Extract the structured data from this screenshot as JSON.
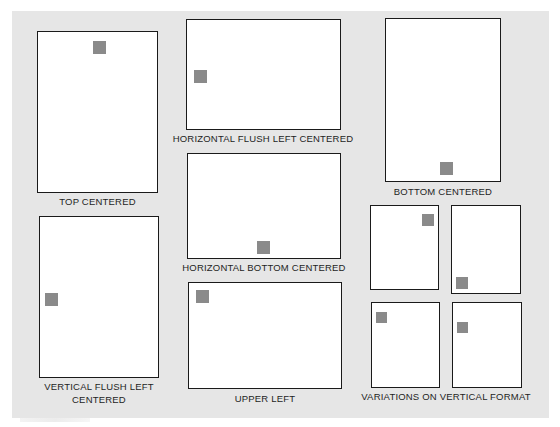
{
  "figure": {
    "background_color": "#e6e6e6",
    "page_color": "#ffffff",
    "page_border_color": "#1a1a1a",
    "mark_color": "#8a8a8a",
    "diagrams": [
      {
        "id": "top-centered",
        "label": "TOP CENTERED",
        "orientation": "vertical",
        "mark_position": "top-center"
      },
      {
        "id": "horizontal-flush-left-centered",
        "label": "HORIZONTAL FLUSH LEFT CENTERED",
        "orientation": "horizontal",
        "mark_position": "middle-left"
      },
      {
        "id": "bottom-centered",
        "label": "BOTTOM CENTERED",
        "orientation": "vertical",
        "mark_position": "bottom-center"
      },
      {
        "id": "horizontal-bottom-centered",
        "label": "HORIZONTAL BOTTOM CENTERED",
        "orientation": "horizontal",
        "mark_position": "bottom-center"
      },
      {
        "id": "vertical-flush-left-centered",
        "label_line1": "VERTICAL FLUSH LEFT",
        "label_line2": "CENTERED",
        "orientation": "vertical",
        "mark_position": "middle-left"
      },
      {
        "id": "upper-left",
        "label": "UPPER LEFT",
        "orientation": "horizontal",
        "mark_position": "top-left"
      },
      {
        "id": "variations-on-vertical-format",
        "label": "VARIATIONS ON VERTICAL FORMAT",
        "orientation": "vertical",
        "variants": [
          {
            "mark_position": "top-right"
          },
          {
            "mark_position": "bottom-left"
          },
          {
            "mark_position": "top-left"
          },
          {
            "mark_position": "upper-left-inset"
          }
        ]
      }
    ]
  }
}
